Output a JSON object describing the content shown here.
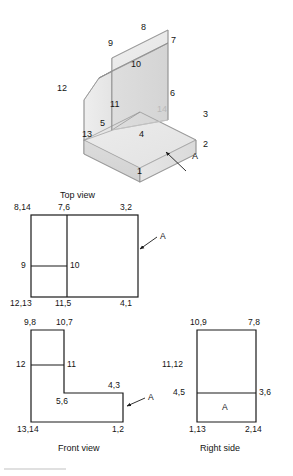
{
  "figure": {
    "kind": "orthographic-projection-exercise",
    "stroke_color": "#1a1a1a",
    "hidden_label_color": "#b9b9b9",
    "surface_label": "A"
  },
  "isometric": {
    "name": "isometric-pictorial",
    "vertex_labels": [
      {
        "id": "v1",
        "text": "1"
      },
      {
        "id": "v2",
        "text": "2"
      },
      {
        "id": "v3",
        "text": "3"
      },
      {
        "id": "v4",
        "text": "4"
      },
      {
        "id": "v5",
        "text": "5"
      },
      {
        "id": "v6",
        "text": "6"
      },
      {
        "id": "v7",
        "text": "7"
      },
      {
        "id": "v8",
        "text": "8"
      },
      {
        "id": "v9",
        "text": "9"
      },
      {
        "id": "v10",
        "text": "10"
      },
      {
        "id": "v11",
        "text": "11"
      },
      {
        "id": "v12",
        "text": "12"
      },
      {
        "id": "v13",
        "text": "13"
      },
      {
        "id": "v14",
        "text": "14"
      }
    ],
    "surface_callout": "A"
  },
  "views": [
    {
      "id": "top",
      "title": "Top view",
      "callout": "A",
      "labels": [
        "8,14",
        "7,6",
        "3,2",
        "9",
        "10",
        "12,13",
        "11,5",
        "4,1"
      ]
    },
    {
      "id": "front",
      "title": "Front view",
      "callout": "A",
      "labels": [
        "9,8",
        "10,7",
        "12",
        "11",
        "4,3",
        "5,6",
        "13,14",
        "1,2"
      ]
    },
    {
      "id": "right",
      "title": "Right side",
      "callout": "A",
      "labels": [
        "10,9",
        "7,8",
        "11,12",
        "4,5",
        "3,6",
        "A",
        "1,13",
        "2,14"
      ]
    }
  ]
}
